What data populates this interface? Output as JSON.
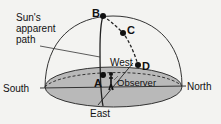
{
  "diagram": {
    "type": "celestial-sphere",
    "caption_path": "Sun's apparent path",
    "caption_lines": [
      "Sun's",
      "apparent",
      "path"
    ],
    "directions": {
      "south": "South",
      "north": "North",
      "east": "East",
      "west": "West"
    },
    "observer_label": "Observer",
    "points": [
      {
        "id": "A",
        "label": "A"
      },
      {
        "id": "B",
        "label": "B"
      },
      {
        "id": "C",
        "label": "C"
      },
      {
        "id": "D",
        "label": "D"
      }
    ],
    "colors": {
      "background": "#f3f3f1",
      "horizon_fill": "#b9b9b9",
      "line": "#222222"
    }
  }
}
